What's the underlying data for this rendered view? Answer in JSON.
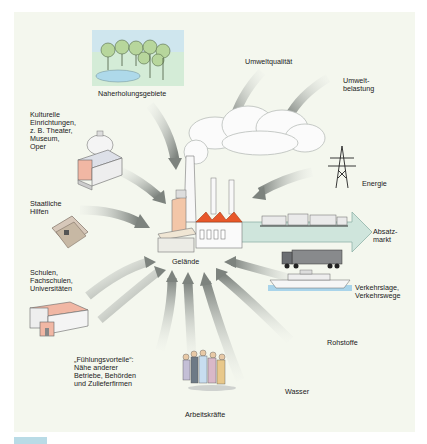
{
  "diagram": {
    "center": {
      "label": "Gelände"
    },
    "factors": [
      {
        "id": "naherholung",
        "label": "Naherholungsgebiete",
        "icon": "park-lake-icon",
        "direction": "in"
      },
      {
        "id": "umweltqualitaet",
        "label": "Umweltqualität",
        "icon": "arrow-icon",
        "direction": "in"
      },
      {
        "id": "umweltbelastung",
        "label": "Umwelt-\nbelastung",
        "icon": "arrow-icon",
        "direction": "in"
      },
      {
        "id": "kultur",
        "label": "Kulturelle\nEinrichtungen,\nz. B. Theater,\nMuseum,\nOper",
        "icon": "theater-building-icon",
        "direction": "in"
      },
      {
        "id": "energie",
        "label": "Energie",
        "icon": "power-pylon-icon",
        "direction": "in"
      },
      {
        "id": "staatlich",
        "label": "Staatliche\nHilfen",
        "icon": "money-bills-icon",
        "direction": "in"
      },
      {
        "id": "absatzmarkt",
        "label": "Absatz-\nmarkt",
        "icon": "freight-train-icon",
        "direction": "out"
      },
      {
        "id": "schulen",
        "label": "Schulen,\nFachschulen,\nUniversitäten",
        "icon": "school-building-icon",
        "direction": "in"
      },
      {
        "id": "verkehr",
        "label": "Verkehrslage,\nVerkehrswege",
        "icon": "truck-ship-icon",
        "direction": "in"
      },
      {
        "id": "rohstoffe",
        "label": "Rohstoffe",
        "icon": "arrow-icon",
        "direction": "in"
      },
      {
        "id": "fuehlung",
        "label": "„Fühlungsvorteile“:\nNähe anderer\nBetriebe, Behörden\nund Zulieferfirmen",
        "icon": "arrow-icon",
        "direction": "in"
      },
      {
        "id": "arbeitskraefte",
        "label": "Arbeitskräfte",
        "icon": "workers-group-icon",
        "direction": "in"
      },
      {
        "id": "wasser",
        "label": "Wasser",
        "icon": "arrow-icon",
        "direction": "in"
      }
    ],
    "colors": {
      "panel_bg": "#f4f7ee",
      "arrow_gray": "#8a8f8a",
      "roof_orange": "#e8572a",
      "outflow_arrow": "#cfe5dc",
      "water_blue": "#a9d4ea",
      "chip_blue": "#b9dbe6"
    }
  }
}
